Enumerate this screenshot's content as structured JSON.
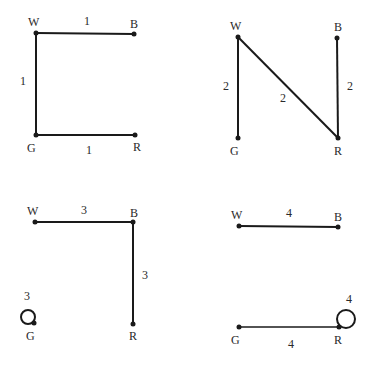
{
  "panels": [
    {
      "id": "graph-1",
      "nodes": {
        "W": "W",
        "B": "B",
        "G": "G",
        "R": "R"
      },
      "edges": [
        {
          "from": "W",
          "to": "B",
          "weight": "1"
        },
        {
          "from": "W",
          "to": "G",
          "weight": "1"
        },
        {
          "from": "G",
          "to": "R",
          "weight": "1"
        }
      ]
    },
    {
      "id": "graph-2",
      "nodes": {
        "W": "W",
        "B": "B",
        "G": "G",
        "R": "R"
      },
      "edges": [
        {
          "from": "W",
          "to": "G",
          "weight": "2"
        },
        {
          "from": "W",
          "to": "R",
          "weight": "2"
        },
        {
          "from": "B",
          "to": "R",
          "weight": "2"
        }
      ]
    },
    {
      "id": "graph-3",
      "nodes": {
        "W": "W",
        "B": "B",
        "G": "G",
        "R": "R"
      },
      "edges": [
        {
          "from": "W",
          "to": "B",
          "weight": "3"
        },
        {
          "from": "B",
          "to": "R",
          "weight": "3"
        },
        {
          "from": "G",
          "to": "G",
          "weight": "3",
          "type": "loop"
        }
      ]
    },
    {
      "id": "graph-4",
      "nodes": {
        "W": "W",
        "B": "B",
        "G": "G",
        "R": "R"
      },
      "edges": [
        {
          "from": "W",
          "to": "B",
          "weight": "4"
        },
        {
          "from": "G",
          "to": "R",
          "weight": "4"
        },
        {
          "from": "R",
          "to": "R",
          "weight": "4",
          "type": "loop"
        }
      ]
    }
  ]
}
